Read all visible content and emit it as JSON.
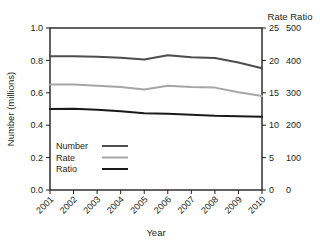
{
  "chart_data": {
    "type": "line",
    "title": "",
    "xlabel": "Year",
    "ylabel": "Number (millions)",
    "categories": [
      "2001",
      "2002",
      "2003",
      "2004",
      "2005",
      "2006",
      "2007",
      "2008",
      "2009",
      "2010"
    ],
    "grid": false,
    "legend_position": "bottom-left",
    "axes": {
      "left": {
        "label": "Number (millions)",
        "ticks": [
          "0.0",
          "0.2",
          "0.4",
          "0.6",
          "0.8",
          "1.0"
        ],
        "min": 0.0,
        "max": 1.0,
        "step": 0.2
      },
      "right_primary": {
        "label": "Rate",
        "ticks": [
          "0",
          "5",
          "10",
          "15",
          "20",
          "25"
        ],
        "min": 0,
        "max": 25,
        "step": 5
      },
      "right_secondary": {
        "label": "Ratio",
        "ticks": [
          "0",
          "100",
          "200",
          "300",
          "400",
          "500"
        ],
        "min": 0,
        "max": 500,
        "step": 100
      },
      "right_header": "Rate Ratio"
    },
    "series": [
      {
        "name": "Number",
        "axis": "left",
        "unit": "millions",
        "color": "#4d4d4d",
        "values": [
          0.825,
          0.825,
          0.822,
          0.817,
          0.805,
          0.832,
          0.82,
          0.815,
          0.787,
          0.752
        ]
      },
      {
        "name": "Rate",
        "axis": "right_primary",
        "unit": "per 100,000",
        "color": "#a6a6a6",
        "values": [
          16.3,
          16.3,
          16.1,
          15.9,
          15.5,
          16.1,
          15.9,
          15.8,
          15.1,
          14.5
        ]
      },
      {
        "name": "Ratio",
        "axis": "right_secondary",
        "unit": "ratio",
        "color": "#1a1a1a",
        "values": [
          250,
          251,
          248,
          243,
          237,
          235,
          232,
          229,
          228,
          226
        ]
      }
    ],
    "legend": [
      {
        "label": "Number",
        "color": "#4d4d4d"
      },
      {
        "label": "Rate",
        "color": "#a6a6a6"
      },
      {
        "label": "Ratio",
        "color": "#1a1a1a"
      }
    ]
  },
  "plot": {
    "left": 50,
    "right": 262,
    "top": 28,
    "bottom": 190
  }
}
